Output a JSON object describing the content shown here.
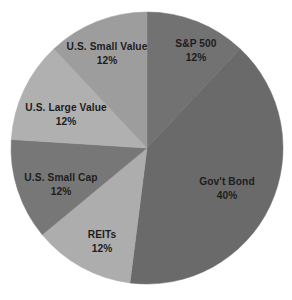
{
  "chart_data": {
    "type": "pie",
    "title": "",
    "subtitle": "",
    "xlabel": "",
    "ylabel": "",
    "legend_position": "none",
    "grid": false,
    "labels_inside_slices": true,
    "start_angle_deg": 0,
    "direction": "clockwise",
    "categories": [
      "S&P 500",
      "Gov't Bond",
      "REITs",
      "U.S. Small Cap",
      "U.S. Large Value",
      "U.S. Small Value"
    ],
    "values": [
      12,
      40,
      12,
      12,
      12,
      12
    ],
    "value_suffix": "%",
    "total": 100,
    "slices": [
      {
        "name": "S&P 500",
        "value": 12,
        "value_text": "12%",
        "color": "#727272",
        "label_x": 196,
        "label_y": 44,
        "value_x": 196,
        "value_y": 58
      },
      {
        "name": "Gov't Bond",
        "value": 40,
        "value_text": "40%",
        "color": "#6a6a6a",
        "label_x": 227,
        "label_y": 182,
        "value_x": 227,
        "value_y": 196
      },
      {
        "name": "REITs",
        "value": 12,
        "value_text": "12%",
        "color": "#adadad",
        "label_x": 102,
        "label_y": 235,
        "value_x": 102,
        "value_y": 249
      },
      {
        "name": "U.S. Small Cap",
        "value": 12,
        "value_text": "12%",
        "color": "#777777",
        "label_x": 61,
        "label_y": 178,
        "value_x": 61,
        "value_y": 192
      },
      {
        "name": "U.S. Large Value",
        "value": 12,
        "value_text": "12%",
        "color": "#b0b0b0",
        "label_x": 66,
        "label_y": 108,
        "value_x": 66,
        "value_y": 122
      },
      {
        "name": "U.S. Small Value",
        "value": 12,
        "value_text": "12%",
        "color": "#9d9d9d",
        "label_x": 107,
        "label_y": 47,
        "value_x": 107,
        "value_y": 61
      }
    ],
    "geometry": {
      "center_x": 147,
      "center_y": 148,
      "radius": 136
    },
    "colors": {
      "background": "#ffffff",
      "label_text": "#1d1d1d"
    }
  }
}
